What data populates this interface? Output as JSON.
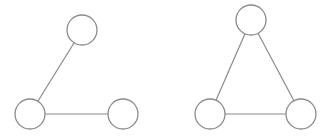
{
  "diagram": {
    "graphs": [
      {
        "name": "path-graph",
        "nodes": [
          {
            "id": "a",
            "cx": 82,
            "cy": 30,
            "r": 15
          },
          {
            "id": "b",
            "cx": 30,
            "cy": 114,
            "r": 15
          },
          {
            "id": "c",
            "cx": 123,
            "cy": 114,
            "r": 15
          }
        ],
        "edges": [
          [
            "a",
            "b"
          ],
          [
            "b",
            "c"
          ]
        ]
      },
      {
        "name": "triangle-graph",
        "nodes": [
          {
            "id": "d",
            "cx": 251,
            "cy": 20,
            "r": 15
          },
          {
            "id": "e",
            "cx": 210,
            "cy": 114,
            "r": 15
          },
          {
            "id": "f",
            "cx": 301,
            "cy": 114,
            "r": 15
          }
        ],
        "edges": [
          [
            "d",
            "e"
          ],
          [
            "e",
            "f"
          ],
          [
            "d",
            "f"
          ]
        ]
      }
    ],
    "colors": {
      "stroke": "#8a8a8a",
      "fill": "#ffffff",
      "background": "#ffffff"
    }
  }
}
